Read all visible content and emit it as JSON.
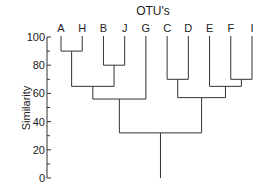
{
  "chart_data": {
    "type": "dendrogram",
    "title": "OTU's",
    "xlabel": "",
    "ylabel": "Similarity",
    "ylim": [
      0,
      100
    ],
    "yticks": [
      0,
      20,
      40,
      60,
      80,
      100
    ],
    "minor_ticks": [
      10,
      30,
      50,
      70,
      90
    ],
    "grid": false,
    "leaves": [
      "A",
      "H",
      "B",
      "J",
      "G",
      "C",
      "D",
      "E",
      "F",
      "I"
    ],
    "merges": [
      {
        "left": "A",
        "right": "H",
        "similarity": 90
      },
      {
        "left": "B",
        "right": "J",
        "similarity": 80
      },
      {
        "left": "A,H",
        "right": "B,J",
        "similarity": 65
      },
      {
        "left": "A,H,B,J",
        "right": "G",
        "similarity": 56
      },
      {
        "left": "C",
        "right": "D",
        "similarity": 70
      },
      {
        "left": "F",
        "right": "I",
        "similarity": 70
      },
      {
        "left": "E",
        "right": "F,I",
        "similarity": 65
      },
      {
        "left": "C,D",
        "right": "E,F,I",
        "similarity": 57
      },
      {
        "left": "A,H,B,J,G",
        "right": "C,D,E,F,I",
        "similarity": 32
      }
    ],
    "root_stem_to": 0
  },
  "labels": {
    "title": "OTU's",
    "ylabel": "Similarity",
    "ytick_labels": [
      "0",
      "20",
      "40",
      "60",
      "80",
      "100"
    ]
  },
  "colors": {
    "line": "#333333",
    "text": "#222222",
    "background": "#ffffff"
  }
}
